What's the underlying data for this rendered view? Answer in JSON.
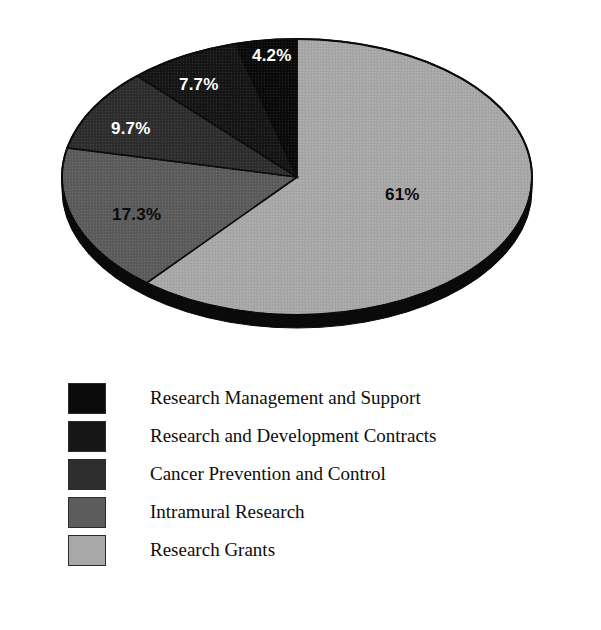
{
  "chart_data": {
    "type": "pie",
    "title": "",
    "subtitle": "",
    "xlabel": "",
    "ylabel": "",
    "grid": false,
    "legend_position": "bottom-left",
    "units": "percent",
    "start_angle_deg": 0,
    "direction": "counterclockwise",
    "three_d": true,
    "categories": [
      "Research Management and Support",
      "Research and Development Contracts",
      "Cancer Prevention and Control",
      "Intramural Research",
      "Research Grants"
    ],
    "values": [
      4.2,
      7.7,
      9.7,
      17.3,
      61
    ],
    "value_labels": [
      "4.2%",
      "7.7%",
      "9.7%",
      "17.3%",
      "61%"
    ],
    "colors": [
      "#0b0b0b",
      "#161616",
      "#2e2e2e",
      "#5c5c5c",
      "#a8a8a8"
    ],
    "label_colors": [
      "#ffffff",
      "#ffffff",
      "#ffffff",
      "#111111",
      "#111111"
    ],
    "slices": [
      {
        "label": "Research Management and Support",
        "value": 4.2,
        "display": "4.2%",
        "color": "#0b0b0b"
      },
      {
        "label": "Research and Development Contracts",
        "value": 7.7,
        "display": "7.7%",
        "color": "#161616"
      },
      {
        "label": "Cancer Prevention and Control",
        "value": 9.7,
        "display": "9.7%",
        "color": "#2e2e2e"
      },
      {
        "label": "Intramural Research",
        "value": 17.3,
        "display": "17.3%",
        "color": "#5c5c5c"
      },
      {
        "label": "Research Grants",
        "value": 61,
        "display": "61%",
        "color": "#a8a8a8"
      }
    ]
  },
  "pie": {
    "labels": [
      {
        "text": "4.2%",
        "x": 252,
        "y": 47,
        "tone": "light"
      },
      {
        "text": "7.7%",
        "x": 179,
        "y": 76,
        "tone": "light"
      },
      {
        "text": "9.7%",
        "x": 111,
        "y": 120,
        "tone": "light"
      },
      {
        "text": "17.3%",
        "x": 112,
        "y": 206,
        "tone": "dark"
      },
      {
        "text": "61%",
        "x": 385,
        "y": 186,
        "tone": "dark"
      }
    ]
  },
  "legend": {
    "items": [
      {
        "label": "Research Management and Support",
        "color": "#0b0b0b"
      },
      {
        "label": "Research and Development Contracts",
        "color": "#161616"
      },
      {
        "label": "Cancer Prevention and Control",
        "color": "#2e2e2e"
      },
      {
        "label": "Intramural Research",
        "color": "#5c5c5c"
      },
      {
        "label": "Research Grants",
        "color": "#a8a8a8"
      }
    ]
  }
}
